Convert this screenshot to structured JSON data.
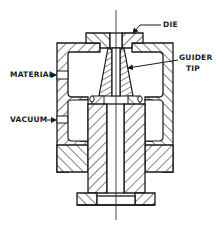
{
  "diagram": {
    "type": "cross-section technical drawing",
    "colors": {
      "ink": "#1a1a1a",
      "background": "#ffffff"
    },
    "labels": {
      "die": "DIE",
      "guider_tip_line1": "GUIDER",
      "guider_tip_line2": "TIP",
      "material": "MATERIAL",
      "vacuum": "VACUUM"
    },
    "components": [
      {
        "id": "die",
        "name": "Die"
      },
      {
        "id": "guider-tip",
        "name": "Guider Tip"
      },
      {
        "id": "body",
        "name": "Crosshead Body"
      },
      {
        "id": "material-port",
        "name": "Material Inlet"
      },
      {
        "id": "vacuum-port",
        "name": "Vacuum Port"
      },
      {
        "id": "stem",
        "name": "Guider Stem"
      },
      {
        "id": "base-flange",
        "name": "Base Flange"
      }
    ]
  }
}
